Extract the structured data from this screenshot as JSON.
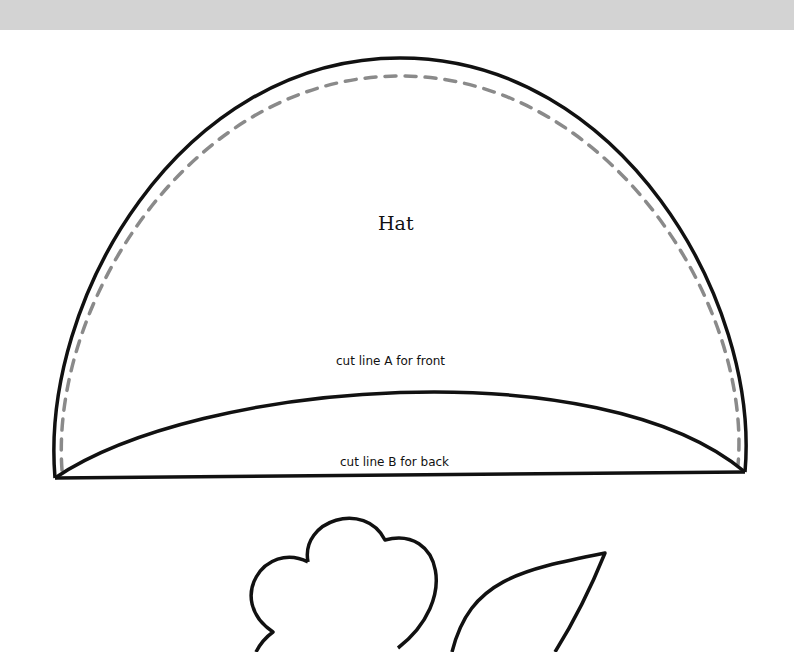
{
  "page": {
    "top_band_color": "#d3d3d3",
    "background": "#ffffff"
  },
  "hat": {
    "title": "Hat",
    "cut_line_a": "cut line A for front",
    "cut_line_b": "cut line B for back",
    "outline_color": "#111111",
    "seam_color": "#8a8a8a"
  },
  "flower": {
    "outline_color": "#111111"
  },
  "leaf": {
    "outline_color": "#111111"
  }
}
